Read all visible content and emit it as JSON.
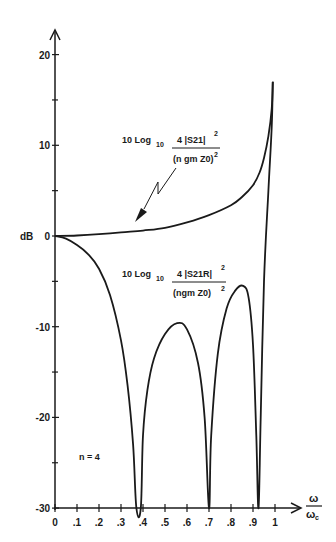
{
  "chart_data": {
    "type": "line",
    "title": "",
    "xlabel": "ω/ωc",
    "ylabel": "dB",
    "xlim": [
      0,
      1.05
    ],
    "ylim": [
      -30,
      22
    ],
    "grid": false,
    "x_ticks": [
      "0",
      ".1",
      ".2",
      ".3",
      ".4",
      ".5",
      ".6",
      ".7",
      ".8",
      ".9",
      "1"
    ],
    "y_ticks": [
      "20",
      "10",
      "0",
      "-10",
      "-20",
      "-30"
    ],
    "annotations": {
      "n_label": "n = 4",
      "upper_label": {
        "prefix": "10 Log",
        "sub": "10",
        "num": "4 |S21|",
        "num_exp": "2",
        "den": "(n gm Z0)",
        "den_exp": "2"
      },
      "lower_label": {
        "prefix": "10 Log",
        "sub": "10",
        "num": "4 |S21R|",
        "num_exp": "2",
        "den": "(ngm  Z0)",
        "den_exp": "2"
      }
    },
    "series": [
      {
        "name": "10 Log10 4|S21|^2/(n gm Z0)^2",
        "x": [
          0,
          0.1,
          0.2,
          0.3,
          0.4,
          0.5,
          0.6,
          0.7,
          0.8,
          0.85,
          0.9,
          0.93,
          0.95,
          0.97,
          0.985,
          0.99
        ],
        "y": [
          0,
          0.05,
          0.2,
          0.4,
          0.6,
          0.9,
          1.5,
          2.3,
          3.4,
          4.3,
          5.6,
          7,
          8.6,
          11,
          14,
          17
        ]
      },
      {
        "name": "10 Log10 4|S21R|^2/(ngm Z0)^2",
        "x": [
          0,
          0.05,
          0.1,
          0.15,
          0.2,
          0.25,
          0.3,
          0.33,
          0.355,
          0.37,
          0.39,
          0.4,
          0.42,
          0.45,
          0.5,
          0.555,
          0.6,
          0.65,
          0.68,
          0.7,
          0.71,
          0.74,
          0.78,
          0.82,
          0.855,
          0.88,
          0.9,
          0.915,
          0.925,
          0.935,
          0.95,
          0.97,
          0.985,
          0.99
        ],
        "y": [
          0,
          -0.3,
          -1,
          -2,
          -3.6,
          -6.5,
          -11.5,
          -16.5,
          -23,
          -30,
          -30,
          -22,
          -17,
          -13.5,
          -10.8,
          -9.6,
          -10.3,
          -14,
          -20,
          -30,
          -22,
          -13,
          -8,
          -6,
          -5.5,
          -6.8,
          -12,
          -22,
          -30,
          -20,
          -5,
          5,
          12,
          17
        ]
      }
    ]
  }
}
